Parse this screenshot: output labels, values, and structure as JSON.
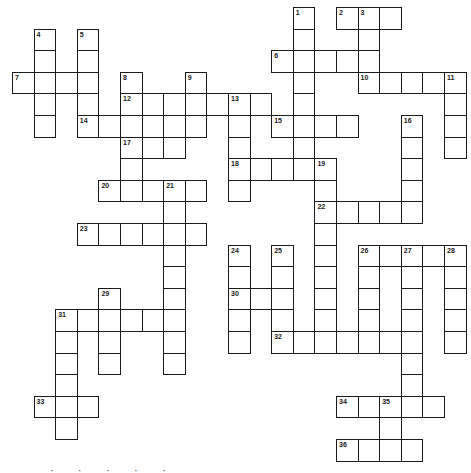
{
  "puzzle": {
    "type": "crossword",
    "grid_origin": {
      "x": 12,
      "y": 7
    },
    "cell_size": 21.6,
    "columns": 21,
    "rows": 21,
    "border_color": "#1a1a1a",
    "background_color": "#ffffff",
    "cells": [
      [
        0,
        13
      ],
      [
        0,
        15
      ],
      [
        0,
        16
      ],
      [
        0,
        17
      ],
      [
        1,
        1
      ],
      [
        1,
        3
      ],
      [
        1,
        13
      ],
      [
        1,
        16
      ],
      [
        2,
        1
      ],
      [
        2,
        3
      ],
      [
        2,
        12
      ],
      [
        2,
        13
      ],
      [
        2,
        14
      ],
      [
        2,
        15
      ],
      [
        2,
        16
      ],
      [
        3,
        0
      ],
      [
        3,
        1
      ],
      [
        3,
        2
      ],
      [
        3,
        3
      ],
      [
        3,
        5
      ],
      [
        3,
        8
      ],
      [
        3,
        13
      ],
      [
        3,
        16
      ],
      [
        3,
        17
      ],
      [
        3,
        18
      ],
      [
        3,
        19
      ],
      [
        3,
        20
      ],
      [
        4,
        1
      ],
      [
        4,
        3
      ],
      [
        4,
        5
      ],
      [
        4,
        6
      ],
      [
        4,
        7
      ],
      [
        4,
        8
      ],
      [
        4,
        9
      ],
      [
        4,
        10
      ],
      [
        4,
        11
      ],
      [
        4,
        13
      ],
      [
        4,
        20
      ],
      [
        5,
        1
      ],
      [
        5,
        3
      ],
      [
        5,
        4
      ],
      [
        5,
        5
      ],
      [
        5,
        6
      ],
      [
        5,
        7
      ],
      [
        5,
        8
      ],
      [
        5,
        10
      ],
      [
        5,
        12
      ],
      [
        5,
        13
      ],
      [
        5,
        14
      ],
      [
        5,
        15
      ],
      [
        5,
        18
      ],
      [
        5,
        20
      ],
      [
        6,
        5
      ],
      [
        6,
        6
      ],
      [
        6,
        7
      ],
      [
        6,
        10
      ],
      [
        6,
        13
      ],
      [
        6,
        18
      ],
      [
        6,
        20
      ],
      [
        7,
        5
      ],
      [
        7,
        10
      ],
      [
        7,
        11
      ],
      [
        7,
        12
      ],
      [
        7,
        13
      ],
      [
        7,
        14
      ],
      [
        7,
        18
      ],
      [
        8,
        4
      ],
      [
        8,
        5
      ],
      [
        8,
        6
      ],
      [
        8,
        7
      ],
      [
        8,
        8
      ],
      [
        8,
        10
      ],
      [
        8,
        14
      ],
      [
        8,
        18
      ],
      [
        9,
        7
      ],
      [
        9,
        14
      ],
      [
        9,
        15
      ],
      [
        9,
        16
      ],
      [
        9,
        17
      ],
      [
        9,
        18
      ],
      [
        10,
        3
      ],
      [
        10,
        4
      ],
      [
        10,
        5
      ],
      [
        10,
        6
      ],
      [
        10,
        7
      ],
      [
        10,
        8
      ],
      [
        10,
        14
      ],
      [
        11,
        7
      ],
      [
        11,
        10
      ],
      [
        11,
        12
      ],
      [
        11,
        14
      ],
      [
        11,
        16
      ],
      [
        11,
        17
      ],
      [
        11,
        18
      ],
      [
        11,
        19
      ],
      [
        11,
        20
      ],
      [
        12,
        7
      ],
      [
        12,
        10
      ],
      [
        12,
        12
      ],
      [
        12,
        14
      ],
      [
        12,
        16
      ],
      [
        12,
        18
      ],
      [
        12,
        20
      ],
      [
        13,
        4
      ],
      [
        13,
        7
      ],
      [
        13,
        10
      ],
      [
        13,
        11
      ],
      [
        13,
        12
      ],
      [
        13,
        14
      ],
      [
        13,
        16
      ],
      [
        13,
        18
      ],
      [
        13,
        20
      ],
      [
        14,
        2
      ],
      [
        14,
        3
      ],
      [
        14,
        4
      ],
      [
        14,
        5
      ],
      [
        14,
        6
      ],
      [
        14,
        7
      ],
      [
        14,
        10
      ],
      [
        14,
        12
      ],
      [
        14,
        14
      ],
      [
        14,
        16
      ],
      [
        14,
        18
      ],
      [
        14,
        20
      ],
      [
        15,
        2
      ],
      [
        15,
        4
      ],
      [
        15,
        7
      ],
      [
        15,
        10
      ],
      [
        15,
        12
      ],
      [
        15,
        13
      ],
      [
        15,
        14
      ],
      [
        15,
        15
      ],
      [
        15,
        16
      ],
      [
        15,
        17
      ],
      [
        15,
        18
      ],
      [
        15,
        20
      ],
      [
        16,
        2
      ],
      [
        16,
        4
      ],
      [
        16,
        7
      ],
      [
        16,
        18
      ],
      [
        17,
        2
      ],
      [
        17,
        18
      ],
      [
        18,
        1
      ],
      [
        18,
        2
      ],
      [
        18,
        3
      ],
      [
        18,
        15
      ],
      [
        18,
        16
      ],
      [
        18,
        17
      ],
      [
        18,
        18
      ],
      [
        18,
        19
      ],
      [
        19,
        2
      ],
      [
        19,
        17
      ],
      [
        20,
        15
      ],
      [
        20,
        16
      ],
      [
        20,
        17
      ],
      [
        20,
        18
      ]
    ],
    "numbers": [
      {
        "n": "1",
        "r": 0,
        "c": 13
      },
      {
        "n": "2",
        "r": 0,
        "c": 15
      },
      {
        "n": "3",
        "r": 0,
        "c": 16
      },
      {
        "n": "4",
        "r": 1,
        "c": 1
      },
      {
        "n": "5",
        "r": 1,
        "c": 3
      },
      {
        "n": "6",
        "r": 2,
        "c": 12
      },
      {
        "n": "7",
        "r": 3,
        "c": 0
      },
      {
        "n": "8",
        "r": 3,
        "c": 5
      },
      {
        "n": "9",
        "r": 3,
        "c": 8
      },
      {
        "n": "10",
        "r": 3,
        "c": 16
      },
      {
        "n": "11",
        "r": 3,
        "c": 20
      },
      {
        "n": "12",
        "r": 4,
        "c": 5
      },
      {
        "n": "13",
        "r": 4,
        "c": 10
      },
      {
        "n": "14",
        "r": 5,
        "c": 3
      },
      {
        "n": "15",
        "r": 5,
        "c": 12
      },
      {
        "n": "16",
        "r": 5,
        "c": 18
      },
      {
        "n": "17",
        "r": 6,
        "c": 5
      },
      {
        "n": "18",
        "r": 7,
        "c": 10
      },
      {
        "n": "19",
        "r": 7,
        "c": 14
      },
      {
        "n": "20",
        "r": 8,
        "c": 4
      },
      {
        "n": "21",
        "r": 8,
        "c": 7
      },
      {
        "n": "22",
        "r": 9,
        "c": 14
      },
      {
        "n": "23",
        "r": 10,
        "c": 3
      },
      {
        "n": "24",
        "r": 11,
        "c": 10
      },
      {
        "n": "25",
        "r": 11,
        "c": 12
      },
      {
        "n": "26",
        "r": 11,
        "c": 16
      },
      {
        "n": "27",
        "r": 11,
        "c": 18
      },
      {
        "n": "28",
        "r": 11,
        "c": 20
      },
      {
        "n": "29",
        "r": 13,
        "c": 4
      },
      {
        "n": "30",
        "r": 13,
        "c": 10
      },
      {
        "n": "31",
        "r": 14,
        "c": 2
      },
      {
        "n": "32",
        "r": 15,
        "c": 12
      },
      {
        "n": "33",
        "r": 18,
        "c": 1
      },
      {
        "n": "34",
        "r": 18,
        "c": 15
      },
      {
        "n": "35",
        "r": 18,
        "c": 17
      },
      {
        "n": "36",
        "r": 20,
        "c": 15
      }
    ]
  },
  "footer": {
    "clipped_text": "· · · · · ·"
  }
}
